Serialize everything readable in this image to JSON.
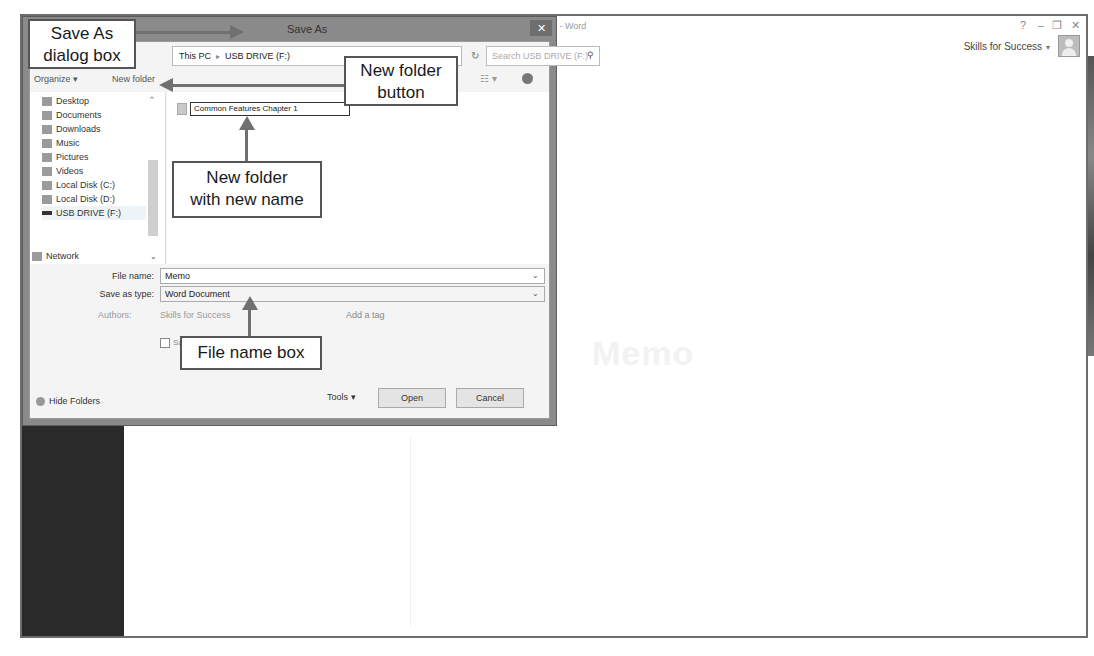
{
  "word": {
    "title": "Document1 - Word",
    "title_visible": "1 - Word",
    "controls": {
      "help": "?",
      "minimize": "–",
      "restore": "❐",
      "close": "✕"
    },
    "account_name": "Skills for Success",
    "account_caret": "▾",
    "avatar_icon": "user-avatar-icon",
    "faint_document_title": "Memo"
  },
  "dialog": {
    "title": "Save As",
    "close": "✕",
    "address": {
      "parts": [
        "This PC",
        "USB DRIVE (F:)"
      ],
      "separator": "▸",
      "caret": "⌄"
    },
    "refresh": "↻",
    "search_placeholder": "Search USB DRIVE (F:)",
    "search_icon": "⚲",
    "toolbar": {
      "organize": "Organize ▾",
      "new_folder": "New folder",
      "view": "☷ ▾",
      "help_icon": "help-icon"
    },
    "nav": {
      "scroll_up": "^",
      "scroll_down": "⌄",
      "items": [
        {
          "label": "Desktop",
          "icon": "desktop-icon"
        },
        {
          "label": "Documents",
          "icon": "documents-icon"
        },
        {
          "label": "Downloads",
          "icon": "downloads-icon"
        },
        {
          "label": "Music",
          "icon": "music-icon"
        },
        {
          "label": "Pictures",
          "icon": "pictures-icon"
        },
        {
          "label": "Videos",
          "icon": "videos-icon"
        },
        {
          "label": "Local Disk (C:)",
          "icon": "drive-icon"
        },
        {
          "label": "Local Disk (D:)",
          "icon": "drive-icon"
        },
        {
          "label": "USB DRIVE (F:)",
          "icon": "usb-drive-icon",
          "selected": true
        },
        {
          "label": "Network",
          "icon": "network-icon"
        }
      ]
    },
    "files": [
      {
        "name": "Common Features Chapter 1",
        "icon": "folder-icon",
        "editing": true
      }
    ],
    "form": {
      "file_name_label": "File name:",
      "file_name_value": "Memo",
      "save_as_type_label": "Save as type:",
      "save_as_type_value": "Word Document",
      "caret": "⌄",
      "authors_label": "Authors:",
      "authors_value": "Skills for Success",
      "tags_label": "Tags:",
      "tags_value": "Add a tag",
      "save_thumbnail_label": "Save Thumbnail",
      "save_thumbnail_checked": false
    },
    "footer": {
      "hide_folders": "Hide Folders",
      "tools": "Tools ▾",
      "open": "Open",
      "cancel": "Cancel"
    }
  },
  "callouts": {
    "save_as_dialog": [
      "Save As",
      "dialog box"
    ],
    "new_folder_button": [
      "New folder",
      "button"
    ],
    "new_folder_name": [
      "New folder",
      "with new name"
    ],
    "file_name_box": [
      "File name box"
    ]
  }
}
